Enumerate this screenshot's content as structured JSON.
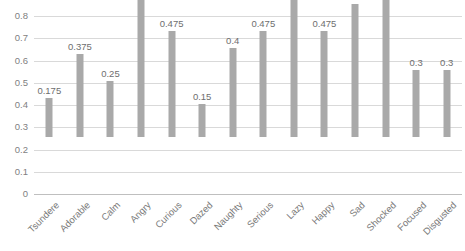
{
  "chart_data": {
    "type": "bar",
    "title": "",
    "subtitle": "",
    "xlabel": "",
    "ylabel": "",
    "ylim": [
      0,
      0.8
    ],
    "ytick_labels": [
      "0.8",
      "0.7",
      "0.6",
      "0.5",
      "0.4",
      "0.3",
      "0.2",
      "0.1",
      "0"
    ],
    "yticks": [
      0.8,
      0.7,
      0.6,
      0.5,
      0.4,
      0.3,
      0.2,
      0.1,
      0
    ],
    "grid": "horizontal",
    "legend": "none",
    "bar_color": "#a9a9a9",
    "categories": [
      "Tsundere",
      "Adorable",
      "Calm",
      "Angry",
      "Curious",
      "Dazed",
      "Naughty",
      "Serious",
      "Lazy",
      "Happy",
      "Sad",
      "Shocked",
      "Focused",
      "Disgusted"
    ],
    "values": [
      0.175,
      0.375,
      0.25,
      0.675,
      0.475,
      0.15,
      0.4,
      0.475,
      0.675,
      0.475,
      0.6,
      0.75,
      0.3,
      0.3
    ],
    "data_labels": [
      "0.175",
      "0.375",
      "0.25",
      "0.675",
      "0.475",
      "0.15",
      "0.4",
      "0.475",
      "0.675",
      "0.475",
      "0.6",
      "0.75",
      "0.3",
      "0.3"
    ],
    "data_labels_shown": true,
    "xlabel_rotation_deg": -45
  }
}
